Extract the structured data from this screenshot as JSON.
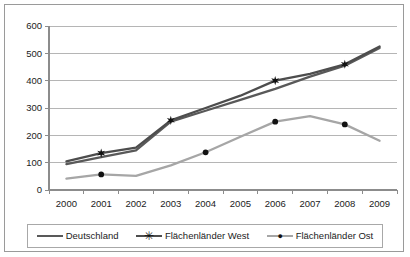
{
  "chart_data": {
    "type": "line",
    "title": "",
    "subtitle": "",
    "xlabel": "",
    "ylabel": "",
    "categories": [
      "2000",
      "2001",
      "2002",
      "2003",
      "2004",
      "2005",
      "2006",
      "2007",
      "2008",
      "2009"
    ],
    "ylim": [
      0,
      600
    ],
    "ytick_step": 100,
    "yticks": [
      "0",
      "100",
      "200",
      "300",
      "400",
      "500",
      "600"
    ],
    "grid": "horizontal",
    "legend_position": "bottom",
    "series": [
      {
        "name": "Deutschland",
        "color": "#595959",
        "marker": "none",
        "values": [
          95,
          120,
          145,
          250,
          290,
          330,
          370,
          415,
          455,
          520
        ]
      },
      {
        "name": "Flächenländer West",
        "color": "#4d4d4d",
        "marker": "star",
        "marker_years": [
          "2001",
          "2003",
          "2006",
          "2008"
        ],
        "values": [
          105,
          135,
          155,
          255,
          300,
          345,
          400,
          425,
          460,
          525
        ]
      },
      {
        "name": "Flächenländer Ost",
        "color": "#a6a6a6",
        "marker": "dot",
        "marker_years": [
          "2001",
          "2004",
          "2006",
          "2008"
        ],
        "values": [
          42,
          57,
          52,
          90,
          138,
          195,
          250,
          270,
          240,
          180
        ]
      }
    ]
  },
  "legend": {
    "items": [
      {
        "label": "Deutschland",
        "marker_glyph": ""
      },
      {
        "label": "Flächenländer West",
        "marker_glyph": "✳"
      },
      {
        "label": "Flächenländer Ost",
        "marker_glyph": "●"
      }
    ]
  },
  "colors": {
    "frame_border": "#9a9a9a",
    "legend_border": "#a8a8a8",
    "gridline": "#b5b5b5",
    "axis": "#8c8c8c",
    "text": "#1b1b1b",
    "plot_background": "#ffffff"
  }
}
